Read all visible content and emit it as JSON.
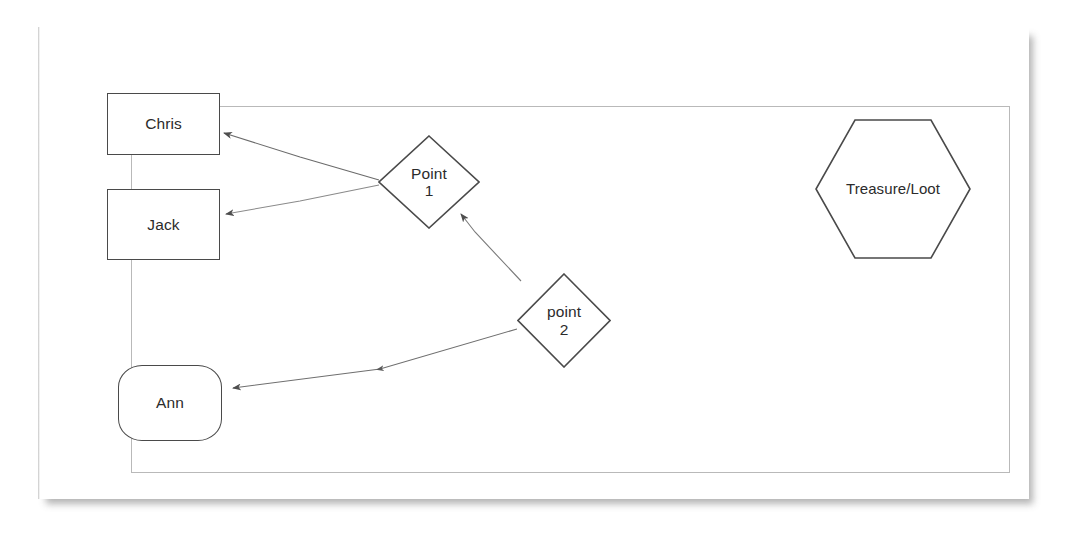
{
  "document": {
    "type": "scanned-diagram-page",
    "background_color": "#ffffff",
    "sheet_color": "#ffffff",
    "frame_border_color": "#b9b9b9",
    "shape_stroke_color": "#4a4a4a",
    "connector_color": "#6e6e6e",
    "text_color": "#2b2b2b"
  },
  "diagram": {
    "title": "",
    "nodes": [
      {
        "id": "chris",
        "label": "Chris",
        "shape": "rectangle",
        "line1": "Chris",
        "line2": ""
      },
      {
        "id": "jack",
        "label": "Jack",
        "shape": "rectangle",
        "line1": "Jack",
        "line2": ""
      },
      {
        "id": "ann",
        "label": "Ann",
        "shape": "rounded-rectangle",
        "line1": "Ann",
        "line2": ""
      },
      {
        "id": "point1",
        "label": "Point 1",
        "shape": "diamond",
        "line1": "Point",
        "line2": "1"
      },
      {
        "id": "point2",
        "label": "point 2",
        "shape": "diamond",
        "line1": "point",
        "line2": "2"
      },
      {
        "id": "treasure",
        "label": "Treasure/Loot",
        "shape": "hexagon",
        "line1": "Treasure/Loot",
        "line2": ""
      }
    ],
    "edges": [
      {
        "id": "edge-point1-chris",
        "from": "point1",
        "to": "chris",
        "arrow": "to-target",
        "style": "solid"
      },
      {
        "id": "edge-point1-jack",
        "from": "point1",
        "to": "jack",
        "arrow": "to-target",
        "style": "solid"
      },
      {
        "id": "edge-point2-point1",
        "from": "point2",
        "to": "point1",
        "arrow": "to-target",
        "style": "solid"
      },
      {
        "id": "edge-point2-ann",
        "from": "point2",
        "to": "ann",
        "arrow": "to-target",
        "style": "solid"
      }
    ]
  }
}
